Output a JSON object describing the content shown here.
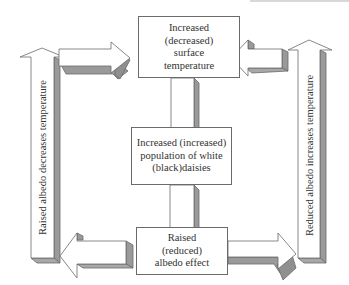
{
  "diagram": {
    "boxes": {
      "surface_temperature": {
        "lines": [
          "Increased",
          "(decreased)",
          "surface",
          "temperature"
        ]
      },
      "daisy_population": {
        "lines": [
          "Increased (increased)",
          "population of white",
          "(black)daisies"
        ]
      },
      "albedo_effect": {
        "lines": [
          "Raised",
          "(reduced)",
          "albedo effect"
        ]
      }
    },
    "side_arrows": {
      "left": {
        "label": "Raised albedo decreases temperature",
        "direction": "up"
      },
      "right": {
        "label": "Reduced albedo increases temperature",
        "direction": "up"
      }
    },
    "connectors": [
      {
        "from": "left-vertical-arrow",
        "to": "surface_temperature",
        "direction": "right"
      },
      {
        "from": "right-vertical-arrow",
        "to": "surface_temperature",
        "direction": "left"
      },
      {
        "from": "surface_temperature",
        "to": "daisy_population",
        "direction": "down"
      },
      {
        "from": "daisy_population",
        "to": "albedo_effect",
        "direction": "down"
      },
      {
        "from": "albedo_effect",
        "to": "left-vertical-arrow",
        "direction": "left"
      },
      {
        "from": "albedo_effect",
        "to": "right-vertical-arrow",
        "direction": "right"
      }
    ],
    "colors": {
      "arrow_fill": "#ffffff",
      "arrow_shadow": "#9a9a9a",
      "arrow_stroke": "#6a6a6a",
      "text": "#333333"
    }
  }
}
